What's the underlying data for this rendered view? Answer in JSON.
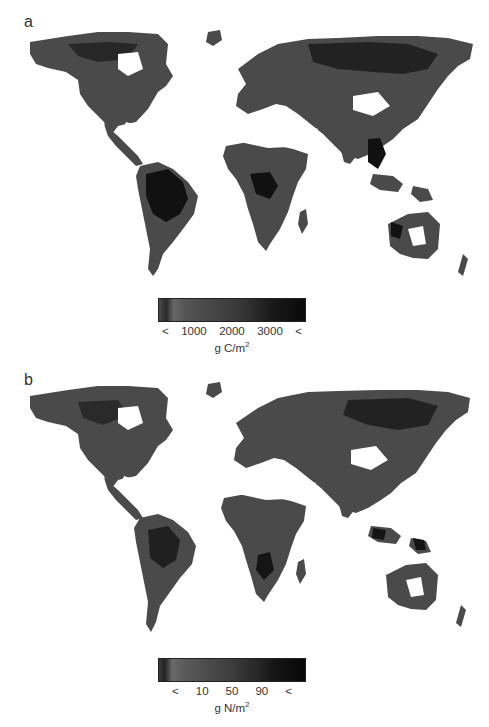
{
  "panels": [
    {
      "label": "a",
      "variable": "carbon",
      "legend": {
        "ticks": [
          "<",
          "1000",
          "2000",
          "3000",
          "<"
        ],
        "unit_base": "g C/m",
        "unit_sup": "2"
      }
    },
    {
      "label": "b",
      "variable": "nitrogen",
      "legend": {
        "ticks": [
          "<",
          "10",
          "50",
          "90",
          "<"
        ],
        "unit_base": "g N/m",
        "unit_sup": "2"
      }
    }
  ],
  "colors": {
    "land_mid": "#4a4a4a",
    "land_dark": "#111111",
    "background": "#ffffff"
  }
}
